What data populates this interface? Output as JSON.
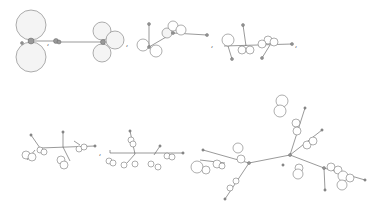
{
  "figure": {
    "separator": ",",
    "row1": {
      "panels": [
        {
          "id": "stage-1",
          "cx": 28,
          "cy": 40
        },
        {
          "id": "stage-2",
          "cx": 103,
          "cy": 40
        },
        {
          "id": "stage-3",
          "cx": 160,
          "cy": 40
        },
        {
          "id": "stage-4",
          "cx": 245,
          "cy": 45
        }
      ]
    },
    "row2": {
      "panels": [
        {
          "id": "stage-5",
          "cx": 55,
          "cy": 150
        },
        {
          "id": "stage-6",
          "cx": 145,
          "cy": 155
        },
        {
          "id": "stage-7",
          "cx": 290,
          "cy": 150
        }
      ]
    }
  }
}
